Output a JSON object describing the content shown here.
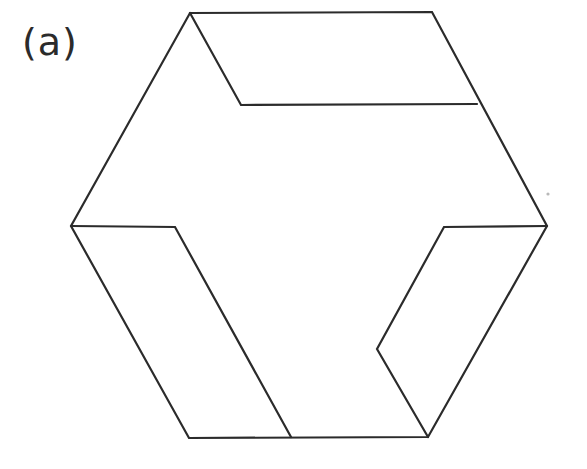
{
  "figure": {
    "panel_label": "(a)",
    "kind": "impossible-figure-line-drawing",
    "canvas": {
      "width": 587,
      "height": 469
    },
    "colors": {
      "background": "#ffffff",
      "stroke": "#2b2b2b",
      "label": "#2b2b2b",
      "speck": "#b9b9b9"
    },
    "stroke_width": 2.2,
    "outline": {
      "name": "hexagon-outline",
      "points": "190,13 432,12 547,226 428,437 189,438 71,226",
      "vertices": [
        {
          "name": "top-left",
          "x": 190,
          "y": 13
        },
        {
          "name": "top-right",
          "x": 432,
          "y": 12
        },
        {
          "name": "right",
          "x": 547,
          "y": 226
        },
        {
          "name": "bottom-right",
          "x": 428,
          "y": 437
        },
        {
          "name": "bottom-left",
          "x": 189,
          "y": 438
        },
        {
          "name": "left",
          "x": 71,
          "y": 226
        }
      ]
    },
    "inner_bars": [
      {
        "name": "top-bar",
        "points": "190,13 241,105 477,104"
      },
      {
        "name": "left-bar",
        "points": "71,226 175,227 291,437"
      },
      {
        "name": "right-bar",
        "points": "547,226 444,227 377,349 428,437"
      }
    ],
    "speck": {
      "name": "scan-speck",
      "cx": 548,
      "cy": 194,
      "r": 1.6
    }
  }
}
